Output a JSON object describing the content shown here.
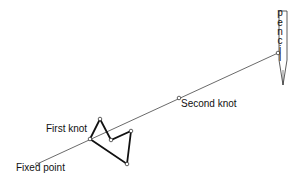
{
  "labels": {
    "fixed_point": "Fixed point",
    "first_knot": "First knot",
    "second_knot": "Second knot",
    "pencil": [
      "p",
      "e",
      "n",
      "c",
      "i",
      "l"
    ]
  },
  "colors": {
    "line": "#333333",
    "polygon": "#111111",
    "background": "#ffffff"
  }
}
